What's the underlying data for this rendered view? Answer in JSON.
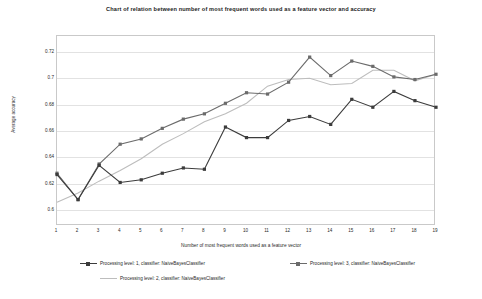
{
  "chart_data": {
    "type": "line",
    "title": "Chart of relation between number of most frequent words used as a feature vector and accuracy",
    "xlabel": "Number of most frequent words used as a feature vector",
    "ylabel": "Average accuracy",
    "x": [
      1,
      2,
      3,
      4,
      5,
      6,
      7,
      8,
      9,
      10,
      11,
      12,
      13,
      14,
      15,
      16,
      17,
      18,
      19
    ],
    "xticklabels": [
      "1",
      "2",
      "3",
      "4",
      "5",
      "6",
      "7",
      "8",
      "9",
      "10",
      "11",
      "12",
      "13",
      "14",
      "15",
      "16",
      "17",
      "18",
      "19"
    ],
    "yticklabels": [
      "0.72",
      "0.7",
      "0.68",
      "0.66",
      "0.64",
      "0.62",
      "0.6"
    ],
    "yticks": [
      0.72,
      0.7,
      0.68,
      0.66,
      0.64,
      0.62,
      0.6
    ],
    "ylim": [
      0.588,
      0.732
    ],
    "xlim": [
      1,
      19
    ],
    "grid": true,
    "legend_position": "below",
    "series": [
      {
        "name": "Processing level: 1, classifier: NaiveBayesClassifier",
        "color": "#3c3c3c",
        "marker": "square",
        "values": [
          0.627,
          0.608,
          0.634,
          0.621,
          0.623,
          0.628,
          0.632,
          0.631,
          0.663,
          0.655,
          0.655,
          0.668,
          0.671,
          0.665,
          0.684,
          0.678,
          0.69,
          0.683,
          0.678
        ]
      },
      {
        "name": "Processing level: 2, classifier: NaiveBayesClassifier",
        "color": "#bdbdbd",
        "marker": "none",
        "values": [
          0.606,
          0.613,
          0.622,
          0.63,
          0.639,
          0.65,
          0.658,
          0.667,
          0.673,
          0.681,
          0.694,
          0.699,
          0.7,
          0.695,
          0.696,
          0.706,
          0.706,
          0.698,
          0.703
        ]
      },
      {
        "name": "Processing level: 3, classifier: NaiveBayesClassifier",
        "color": "#6b6b6b",
        "marker": "square",
        "values": [
          0.628,
          0.608,
          0.635,
          0.65,
          0.654,
          0.662,
          0.669,
          0.673,
          0.681,
          0.689,
          0.688,
          0.697,
          0.716,
          0.702,
          0.713,
          0.709,
          0.701,
          0.699,
          0.703
        ]
      }
    ]
  }
}
